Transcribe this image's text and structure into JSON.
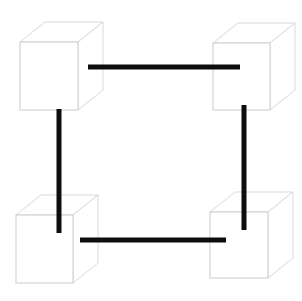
{
  "figure": {
    "canvas": {
      "width": 302,
      "height": 301,
      "background": "#ffffff"
    },
    "style": {
      "cube_stroke": "#d9d9d9",
      "cube_stroke_dark": "#cccccc",
      "cube_fill": "#ffffff",
      "cube_stroke_width": 1,
      "bar_color": "#0d0d0d",
      "bar_thickness": 5
    },
    "cubes": [
      {
        "name": "top-left-cube",
        "position": "top-left",
        "front_face": {
          "x": 20,
          "y": 42,
          "width": 58,
          "height": 68
        },
        "depth_x": 25,
        "depth_y": -20
      },
      {
        "name": "top-right-cube",
        "position": "top-right",
        "front_face": {
          "x": 213,
          "y": 43,
          "width": 57,
          "height": 67
        },
        "depth_x": 25,
        "depth_y": -20
      },
      {
        "name": "bottom-left-cube",
        "position": "bottom-left",
        "front_face": {
          "x": 16,
          "y": 215,
          "width": 57,
          "height": 68
        },
        "depth_x": 25,
        "depth_y": -20
      },
      {
        "name": "bottom-right-cube",
        "position": "bottom-right",
        "front_face": {
          "x": 210,
          "y": 212,
          "width": 58,
          "height": 66
        },
        "depth_x": 25,
        "depth_y": -20
      }
    ],
    "bars": [
      {
        "name": "top-horizontal-bar",
        "orientation": "horizontal",
        "x1": 88,
        "y1": 67,
        "x2": 240,
        "y2": 67,
        "connects": [
          "top-left-cube",
          "top-right-cube"
        ]
      },
      {
        "name": "bottom-horizontal-bar",
        "orientation": "horizontal",
        "x1": 80,
        "y1": 240,
        "x2": 226,
        "y2": 240,
        "connects": [
          "bottom-left-cube",
          "bottom-right-cube"
        ]
      },
      {
        "name": "left-vertical-bar",
        "orientation": "vertical",
        "x1": 59,
        "y1": 109,
        "x2": 59,
        "y2": 233,
        "connects": [
          "top-left-cube",
          "bottom-left-cube"
        ]
      },
      {
        "name": "right-vertical-bar",
        "orientation": "vertical",
        "x1": 244,
        "y1": 105,
        "x2": 244,
        "y2": 230,
        "connects": [
          "top-right-cube",
          "bottom-right-cube"
        ]
      }
    ]
  }
}
